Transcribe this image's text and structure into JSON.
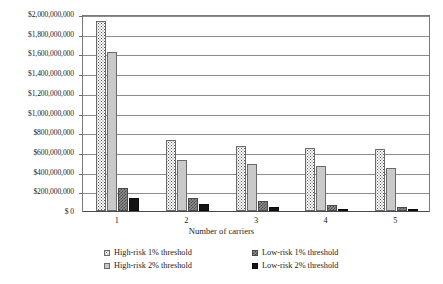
{
  "chart_data": {
    "type": "bar",
    "title": "",
    "xlabel": "Number of carriers",
    "ylabel": "",
    "categories": [
      "1",
      "2",
      "3",
      "4",
      "5"
    ],
    "ylim": [
      0,
      2000000000
    ],
    "ytick_step": 200000000,
    "ytick_labels": [
      "$2,000,000,000",
      "$1,800,000,000",
      "$1,600,000,000",
      "$1,400,000,000",
      "$1,200,000,000",
      "$1,000,000,000",
      "$800,000,000",
      "$600,000,000",
      "$400,000,000",
      "$200,000,000",
      "$ 0"
    ],
    "ytick_values": [
      2000000000,
      1800000000,
      1600000000,
      1400000000,
      1200000000,
      1000000000,
      800000000,
      600000000,
      400000000,
      200000000,
      0
    ],
    "grid": true,
    "legend_position": "bottom",
    "series": [
      {
        "name": "High-risk 1% threshold",
        "key": "hr1",
        "style": "white-dotted",
        "values": [
          1930000000,
          720000000,
          660000000,
          640000000,
          625000000
        ]
      },
      {
        "name": "High-risk 2% threshold",
        "key": "hr2",
        "style": "light-gray",
        "values": [
          1615000000,
          520000000,
          480000000,
          460000000,
          440000000
        ]
      },
      {
        "name": "Low-risk 1% threshold",
        "key": "lr1",
        "style": "gray-checkered",
        "values": [
          235000000,
          130000000,
          100000000,
          65000000,
          45000000
        ]
      },
      {
        "name": "Low-risk 2% threshold",
        "key": "lr2",
        "style": "black",
        "values": [
          130000000,
          70000000,
          45000000,
          22000000,
          10000000
        ]
      }
    ]
  },
  "legend": {
    "rows": [
      [
        {
          "label": "High-risk 1% threshold",
          "swatch": "white-dotted"
        },
        {
          "label": "Low-risk 1% threshold",
          "swatch": "gray-checkered"
        }
      ],
      [
        {
          "label": "High-risk 2% threshold",
          "swatch": "light-gray"
        },
        {
          "label": "Low-risk 2% threshold",
          "swatch": "black"
        }
      ]
    ]
  },
  "colors": {
    "light_gray": "#c9c9c9",
    "dark_gray": "#8f8f8f",
    "black": "#141414",
    "axis": "#7a7a7a",
    "gridline": "#8c8c8c",
    "text": "#1c1c1c"
  }
}
